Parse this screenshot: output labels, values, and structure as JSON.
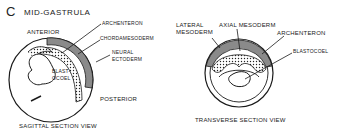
{
  "figure": {
    "panel_letter": "C",
    "title": "MID-GASTRULA",
    "colors": {
      "ink": "#1a1a1a",
      "mesoderm_gray": "#8a8a8a",
      "background": "#ffffff"
    }
  },
  "sagittal": {
    "caption": "SAGITTAL SECTION VIEW",
    "labels": {
      "anterior": "ANTERIOR",
      "archenteron": "ARCHENTERON",
      "chordamesoderm": "CHORDAMESODERM",
      "neural_ectoderm_line1": "NEURAL",
      "neural_ectoderm_line2": "ECTODERM",
      "blastocoel_line1": "BLAST-",
      "blastocoel_line2": "OCOEL",
      "posterior": "POSTERIOR"
    }
  },
  "transverse": {
    "caption": "TRANSVERSE SECTION VIEW",
    "labels": {
      "lateral_mesoderm_line1": "LATERAL",
      "lateral_mesoderm_line2": "MESODERM",
      "axial_mesoderm": "AXIAL MESODERM",
      "archenteron": "ARCHENTERON",
      "blastocoel": "BLASTOCOEL"
    }
  }
}
